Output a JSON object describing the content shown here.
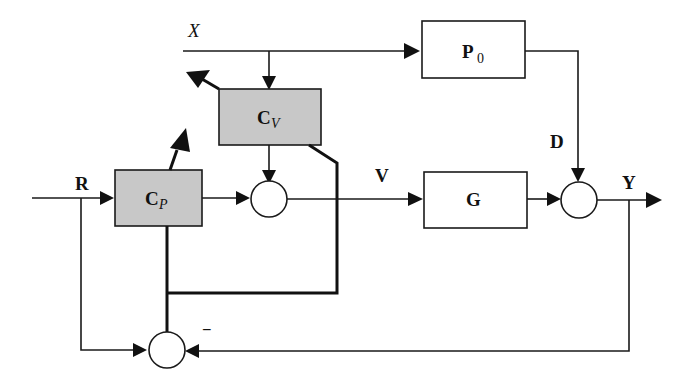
{
  "diagram": {
    "type": "control-block-diagram",
    "signals": {
      "x": "X",
      "r": "R",
      "v": "V",
      "d": "D",
      "y": "Y"
    },
    "blocks": {
      "p0": {
        "main": "P",
        "sub": "0"
      },
      "cv": {
        "main": "C",
        "sub": "V"
      },
      "cp": {
        "main": "C",
        "sub": "P"
      },
      "g": {
        "main": "G"
      }
    },
    "signs": {
      "bottom_sum_minus": "−"
    },
    "colors": {
      "controller_fill": "#c8c8c8",
      "line": "#1a1a1a",
      "background": "#ffffff"
    }
  }
}
